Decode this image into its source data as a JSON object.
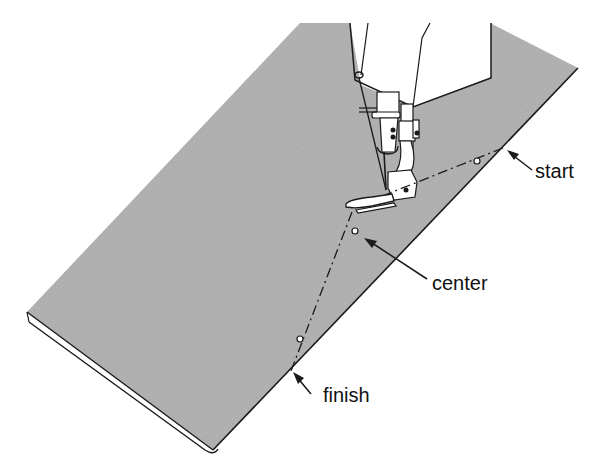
{
  "figure": {
    "colors": {
      "fabric": "#a9a9a9",
      "outline": "#1a1a1a",
      "background": "#ffffff",
      "machine": "#ffffff"
    }
  },
  "labels": {
    "start": "start",
    "center": "center",
    "finish": "finish"
  },
  "points": {
    "start": {
      "x": 503,
      "y": 148
    },
    "start_dot": {
      "x": 477,
      "y": 161
    },
    "needle": {
      "x": 385,
      "y": 195
    },
    "center_dot": {
      "x": 355,
      "y": 231
    },
    "finish_dot": {
      "x": 300,
      "y": 339
    },
    "finish": {
      "x": 291,
      "y": 371
    }
  }
}
